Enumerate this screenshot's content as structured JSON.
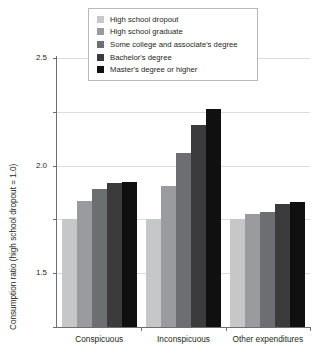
{
  "chart_data": {
    "type": "bar",
    "title": "",
    "xlabel": "",
    "ylabel": "Consumption ratio (high school dropout = 1.0)",
    "ylim": [
      0.0,
      2.5
    ],
    "yticks": [
      "0.0",
      "0.5",
      "1.0",
      "1.5",
      "2.0",
      "2.5"
    ],
    "ytick_values": [
      0.0,
      0.5,
      1.0,
      1.5,
      2.0,
      2.5
    ],
    "grid": "horizontal",
    "legend_position": "top-center",
    "categories": [
      "Conspicuous",
      "Inconspicuous",
      "Other expenditures"
    ],
    "series": [
      {
        "name": "High school dropout",
        "color": "#c6c7c9",
        "values": [
          1.0,
          1.0,
          1.0
        ]
      },
      {
        "name": "High school graduate",
        "color": "#9a9b9e",
        "values": [
          1.17,
          1.31,
          1.05
        ]
      },
      {
        "name": "Some college and associate's degree",
        "color": "#6d6e71",
        "values": [
          1.28,
          1.62,
          1.07
        ]
      },
      {
        "name": "Bachelor's degree",
        "color": "#3b3b3d",
        "values": [
          1.34,
          1.88,
          1.14
        ]
      },
      {
        "name": "Master's degree or higher",
        "color": "#101010",
        "values": [
          1.35,
          2.03,
          1.16
        ]
      }
    ]
  }
}
